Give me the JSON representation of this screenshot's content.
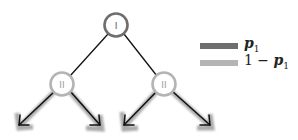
{
  "diagram": {
    "type": "binary-tree",
    "nodes": [
      {
        "id": "root",
        "label": "I",
        "x": 116,
        "y": 25,
        "stroke": "#6e6e6e"
      },
      {
        "id": "left",
        "label": "II",
        "x": 62,
        "y": 84,
        "stroke": "#b4b4b4"
      },
      {
        "id": "right",
        "label": "II",
        "x": 164,
        "y": 84,
        "stroke": "#b4b4b4"
      }
    ],
    "edges": [
      {
        "from": "root",
        "to": "left"
      },
      {
        "from": "root",
        "to": "right"
      }
    ],
    "arrows": [
      {
        "from": "left",
        "direction": "down-left"
      },
      {
        "from": "left",
        "direction": "down-right"
      },
      {
        "from": "right",
        "direction": "down-left"
      },
      {
        "from": "right",
        "direction": "down-right"
      }
    ]
  },
  "legend": {
    "items": [
      {
        "color": "#6e6e6e",
        "label_var": "p",
        "label_sub": "1",
        "label_prefix": ""
      },
      {
        "color": "#b4b4b4",
        "label_var": "p",
        "label_sub": "1",
        "label_prefix": "1 − "
      }
    ]
  }
}
